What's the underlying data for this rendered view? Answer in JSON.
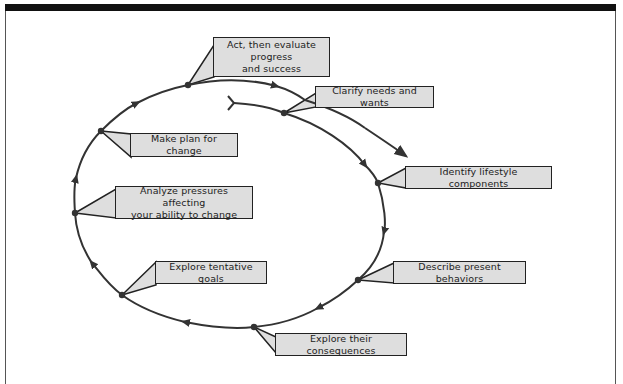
{
  "diagram": {
    "type": "cycle",
    "direction": "clockwise spiral",
    "start_marker": "y-shaped tail",
    "colors": {
      "line": "#333333",
      "label_fill": "#dedede",
      "label_border": "#222222",
      "top_bar": "#111111"
    },
    "steps": [
      {
        "id": "clarify",
        "order": 1,
        "text": "Clarify needs and wants"
      },
      {
        "id": "identify",
        "order": 2,
        "text": "Identify lifestyle components"
      },
      {
        "id": "describe",
        "order": 3,
        "text": "Describe present behaviors"
      },
      {
        "id": "consequences",
        "order": 4,
        "text": "Explore their consequences"
      },
      {
        "id": "goals",
        "order": 5,
        "text": "Explore tentative goals"
      },
      {
        "id": "analyze",
        "order": 6,
        "text": "Analyze pressures affecting your ability to change",
        "lines": [
          "Analyze pressures affecting",
          "your ability to change"
        ]
      },
      {
        "id": "plan",
        "order": 7,
        "text": "Make plan for change"
      },
      {
        "id": "act",
        "order": 8,
        "text": "Act, then evaluate progress and success",
        "lines": [
          "Act, then evaluate progress",
          "and success"
        ]
      }
    ]
  }
}
